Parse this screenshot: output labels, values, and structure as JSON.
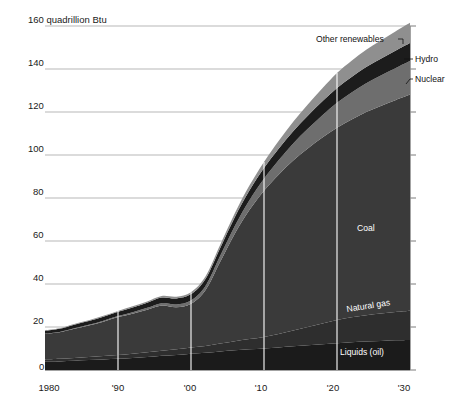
{
  "chart_data": {
    "type": "area",
    "title": "",
    "subtitle": "",
    "xlabel": "",
    "ylabel": "160 quadrillion Btu",
    "yunit": "quadrillion Btu",
    "xlim": [
      1980,
      2030
    ],
    "ylim": [
      0,
      160
    ],
    "ytick_values": [
      0,
      20,
      40,
      60,
      80,
      100,
      120,
      140,
      160
    ],
    "ytick_labels": [
      "0",
      "20",
      "40",
      "60",
      "80",
      "100",
      "120",
      "140",
      "160 quadrillion Btu"
    ],
    "xtick_values": [
      1980,
      1990,
      2000,
      2010,
      2020,
      2030
    ],
    "xtick_labels": [
      "1980",
      "'90",
      "'00",
      "'10",
      "'20",
      "'30"
    ],
    "grid": true,
    "stacked": true,
    "legend_position": "inline-annotations",
    "x": [
      1980,
      1982,
      1984,
      1986,
      1988,
      1990,
      1992,
      1994,
      1996,
      1998,
      2000,
      2002,
      2004,
      2006,
      2008,
      2010,
      2012,
      2014,
      2016,
      2018,
      2020,
      2022,
      2024,
      2026,
      2028,
      2030
    ],
    "series": [
      {
        "name": "Liquids (oil)",
        "label": "Liquids (oil)",
        "color": "#1b1b1b",
        "values": [
          3.8,
          4.0,
          4.3,
          4.6,
          4.9,
          5.2,
          5.6,
          6.0,
          6.6,
          7.0,
          7.6,
          8.0,
          8.6,
          9.2,
          9.6,
          10.0,
          10.5,
          11.0,
          11.5,
          12.0,
          12.5,
          12.9,
          13.2,
          13.5,
          13.8,
          14.0
        ]
      },
      {
        "name": "Natural gas",
        "label": "Natural gas",
        "color": "#2e2e2e",
        "values": [
          1.1,
          1.2,
          1.3,
          1.5,
          1.6,
          1.8,
          2.0,
          2.2,
          2.4,
          2.6,
          2.9,
          3.2,
          3.7,
          4.2,
          4.8,
          5.4,
          6.3,
          7.4,
          8.5,
          9.6,
          10.7,
          11.6,
          12.3,
          12.8,
          13.2,
          13.6
        ]
      },
      {
        "name": "Coal",
        "label": "Coal",
        "color": "#3a3a3a",
        "values": [
          12.0,
          12.4,
          13.6,
          14.6,
          16.0,
          17.6,
          18.6,
          19.8,
          21.0,
          19.6,
          20.3,
          26.0,
          38.0,
          50.0,
          60.0,
          68.0,
          74.0,
          79.0,
          83.0,
          86.5,
          89.5,
          92.0,
          94.5,
          96.5,
          98.5,
          100.5
        ]
      },
      {
        "name": "Nuclear",
        "label": "Nuclear",
        "color": "#6e6e6e",
        "values": [
          0.0,
          0.1,
          0.2,
          0.3,
          0.4,
          0.5,
          0.7,
          0.9,
          1.1,
          1.3,
          1.5,
          2.0,
          2.8,
          3.6,
          4.6,
          5.6,
          6.8,
          8.0,
          9.2,
          10.4,
          11.6,
          12.6,
          13.4,
          14.2,
          14.9,
          15.6
        ]
      },
      {
        "name": "Hydro",
        "label": "Hydro",
        "color": "#1c1c1c",
        "values": [
          1.4,
          1.5,
          1.7,
          1.8,
          1.9,
          2.0,
          2.2,
          2.4,
          2.6,
          2.8,
          3.0,
          3.3,
          3.7,
          4.1,
          4.5,
          4.9,
          5.3,
          5.7,
          6.1,
          6.5,
          6.9,
          7.2,
          7.5,
          7.8,
          8.1,
          8.4
        ]
      },
      {
        "name": "Other renewables",
        "label": "Other renewables",
        "color": "#8f8f8f",
        "values": [
          0.2,
          0.2,
          0.3,
          0.3,
          0.4,
          0.4,
          0.5,
          0.6,
          0.7,
          0.8,
          0.9,
          1.1,
          1.4,
          1.8,
          2.3,
          2.9,
          3.6,
          4.4,
          5.2,
          6.0,
          6.9,
          7.5,
          8.0,
          8.5,
          9.0,
          9.4
        ]
      }
    ],
    "totals": [
      18.5,
      19.4,
      21.4,
      23.1,
      25.2,
      27.5,
      29.6,
      31.9,
      34.4,
      34.1,
      36.2,
      43.6,
      58.2,
      72.9,
      85.8,
      96.8,
      106.5,
      115.5,
      123.5,
      131.0,
      138.1,
      143.8,
      148.9,
      153.3,
      157.5,
      161.5
    ],
    "annotations": [
      {
        "name": "other-renewables-label",
        "text": "Other renewables",
        "placement": "outside-top-right"
      },
      {
        "name": "hydro-label",
        "text": "Hydro",
        "placement": "outside-right"
      },
      {
        "name": "nuclear-label",
        "text": "Nuclear",
        "placement": "outside-right"
      },
      {
        "name": "coal-label",
        "text": "Coal",
        "placement": "inside"
      },
      {
        "name": "natural-gas-label",
        "text": "Natural gas",
        "placement": "inside-rotated"
      },
      {
        "name": "liquids-label",
        "text": "Liquids (oil)",
        "placement": "inside"
      }
    ]
  },
  "axis": {
    "y_top_label": "160 quadrillion Btu",
    "y_140": "140",
    "y_120": "120",
    "y_100": "100",
    "y_80": "80",
    "y_60": "60",
    "y_40": "40",
    "y_20": "20",
    "y_0": "0",
    "x_1980": "1980",
    "x_1990": "'90",
    "x_2000": "'00",
    "x_2010": "'10",
    "x_2020": "'20",
    "x_2030": "'30"
  },
  "labels": {
    "other_renewables": "Other renewables",
    "hydro": "Hydro",
    "nuclear": "Nuclear",
    "coal": "Coal",
    "natural_gas": "Natural gas",
    "liquids": "Liquids (oil)"
  },
  "colors": {
    "background": "#ffffff",
    "liquids": "#1b1b1b",
    "natural_gas": "#2e2e2e",
    "coal": "#3a3a3a",
    "nuclear": "#6e6e6e",
    "hydro": "#1c1c1c",
    "other_renewables": "#8f8f8f",
    "gridline": "#9a9a9a",
    "vertical_rule": "#ffffff",
    "text": "#1a1a1a"
  }
}
